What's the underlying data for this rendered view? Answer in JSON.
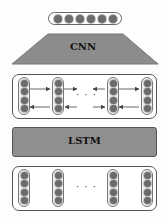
{
  "diagram": {
    "output_vector": {
      "node_count": 6
    },
    "cnn": {
      "label": "CNN",
      "color": "#8c8c8c"
    },
    "bilstm_layer": {
      "columns": 4,
      "nodes_per_column": 4,
      "ellipsis": "· · ·",
      "forward_arrows": "left-to-right (top row)",
      "backward_arrows": "right-to-left (bottom row)"
    },
    "lstm": {
      "label": "LSTM",
      "color": "#8f8f8f"
    },
    "input_layer": {
      "columns": 4,
      "nodes_per_column": 4,
      "ellipsis": "· · ·"
    },
    "node_color": "#6b6b6b"
  }
}
